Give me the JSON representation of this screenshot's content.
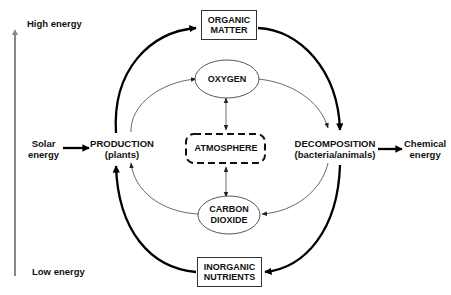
{
  "diagram": {
    "energy_axis": {
      "top_label": "High energy",
      "bottom_label": "Low energy",
      "color": "#888888"
    },
    "nodes": {
      "organic_matter": "ORGANIC\nMATTER",
      "inorganic_nutrients": "INORGANIC\nNUTRIENTS",
      "oxygen": "OXYGEN",
      "carbon_dioxide": "CARBON\nDIOXIDE",
      "atmosphere": "ATMOSPHERE",
      "production": "PRODUCTION",
      "production_sub": "(plants)",
      "decomposition": "DECOMPOSITION",
      "decomposition_sub": "(bacteria/animals)",
      "solar_energy": "Solar\nenergy",
      "chemical_energy": "Chemical\nenergy"
    },
    "edges": [
      {
        "from": "Solar energy",
        "to": "Production",
        "weight": "thick"
      },
      {
        "from": "Production",
        "to": "Organic matter",
        "weight": "thick"
      },
      {
        "from": "Organic matter",
        "to": "Decomposition",
        "weight": "thick"
      },
      {
        "from": "Decomposition",
        "to": "Inorganic nutrients",
        "weight": "thick"
      },
      {
        "from": "Inorganic nutrients",
        "to": "Production",
        "weight": "thick"
      },
      {
        "from": "Decomposition",
        "to": "Chemical energy",
        "weight": "thick"
      },
      {
        "from": "Production",
        "to": "Oxygen",
        "weight": "thin"
      },
      {
        "from": "Oxygen",
        "to": "Decomposition",
        "weight": "thin"
      },
      {
        "from": "Decomposition",
        "to": "Carbon dioxide",
        "weight": "thin"
      },
      {
        "from": "Carbon dioxide",
        "to": "Production",
        "weight": "thin"
      },
      {
        "from": "Oxygen",
        "to": "Atmosphere",
        "weight": "thin",
        "bidirectional": true
      },
      {
        "from": "Atmosphere",
        "to": "Carbon dioxide",
        "weight": "thin",
        "bidirectional": true
      }
    ]
  }
}
